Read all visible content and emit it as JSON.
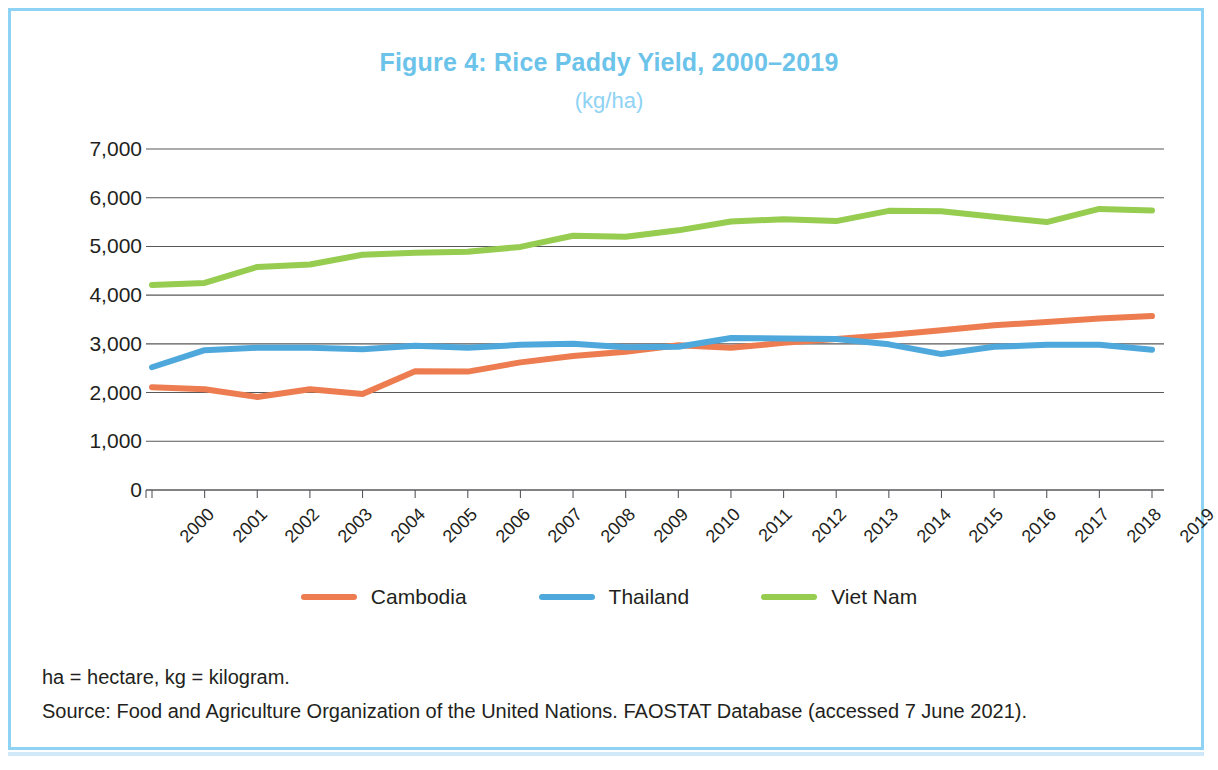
{
  "figure": {
    "title": "Figure 4: Rice Paddy Yield, 2000–2019",
    "subtitle": "(kg/ha)",
    "title_color": "#6cc3ea",
    "frame_color": "#8ed2f4"
  },
  "notes": {
    "abbreviations": "ha = hectare, kg = kilogram.",
    "source": "Source: Food and Agriculture Organization of the United Nations. FAOSTAT Database (accessed 7 June 2021)."
  },
  "legend": {
    "position": "bottom",
    "items": [
      {
        "label": "Cambodia",
        "color": "#ED7D50"
      },
      {
        "label": "Thailand",
        "color": "#4FA8DC"
      },
      {
        "label": "Viet Nam",
        "color": "#96CC4F"
      }
    ]
  },
  "chart_data": {
    "type": "line",
    "title": "Figure 4: Rice Paddy Yield, 2000–2019",
    "subtitle": "(kg/ha)",
    "xlabel": "",
    "ylabel": "",
    "unit": "kg/ha",
    "x": [
      "2000",
      "2001",
      "2002",
      "2003",
      "2004",
      "2005",
      "2006",
      "2007",
      "2008",
      "2009",
      "2010",
      "2011",
      "2012",
      "2013",
      "2014",
      "2015",
      "2016",
      "2017",
      "2018",
      "2019"
    ],
    "categories": [
      "2000",
      "2001",
      "2002",
      "2003",
      "2004",
      "2005",
      "2006",
      "2007",
      "2008",
      "2009",
      "2010",
      "2011",
      "2012",
      "2013",
      "2014",
      "2015",
      "2016",
      "2017",
      "2018",
      "2019"
    ],
    "ylim": [
      0,
      7000
    ],
    "yticks": [
      0,
      1000,
      2000,
      3000,
      4000,
      5000,
      6000,
      7000
    ],
    "ytick_labels": [
      "0",
      "1,000",
      "2,000",
      "3,000",
      "4,000",
      "5,000",
      "6,000",
      "7,000"
    ],
    "grid": "horizontal",
    "legend_position": "bottom",
    "series": [
      {
        "name": "Cambodia",
        "color": "#ED7D50",
        "values": [
          2110,
          2070,
          1910,
          2070,
          1970,
          2440,
          2430,
          2620,
          2750,
          2840,
          2970,
          2920,
          3020,
          3100,
          3180,
          3280,
          3380,
          3450,
          3520,
          3570
        ]
      },
      {
        "name": "Thailand",
        "color": "#4FA8DC",
        "values": [
          2520,
          2870,
          2920,
          2920,
          2890,
          2960,
          2920,
          2980,
          3000,
          2930,
          2940,
          3120,
          3110,
          3100,
          2990,
          2790,
          2940,
          2980,
          2980,
          2880
        ]
      },
      {
        "name": "Viet Nam",
        "color": "#96CC4F",
        "values": [
          4210,
          4250,
          4580,
          4630,
          4830,
          4870,
          4890,
          4990,
          5220,
          5200,
          5330,
          5510,
          5560,
          5520,
          5730,
          5720,
          5610,
          5500,
          5770,
          5740
        ]
      }
    ]
  }
}
